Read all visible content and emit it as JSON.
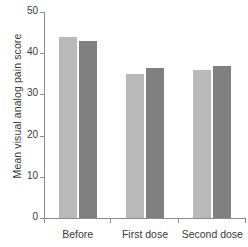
{
  "chart_data": {
    "type": "bar",
    "title": "",
    "subtitle": "",
    "xlabel": "",
    "ylabel": "Mean visual analog pain score",
    "categories": [
      "Before",
      "First dose",
      "Second dose"
    ],
    "ylim": [
      0,
      50
    ],
    "yticks": [
      0,
      10,
      20,
      30,
      40,
      50
    ],
    "ytick_labels": [
      "0",
      "10",
      "20",
      "30",
      "40",
      "50"
    ],
    "grid": false,
    "legend": "none",
    "series": [
      {
        "name": "Group 1",
        "color": "#b9b9b9",
        "values": [
          44,
          35,
          36
        ]
      },
      {
        "name": "Group 2",
        "color": "#808080",
        "values": [
          43,
          36.5,
          37
        ]
      }
    ],
    "axis_color": "#8d8d8d",
    "text_color": "#3a3a3a"
  }
}
